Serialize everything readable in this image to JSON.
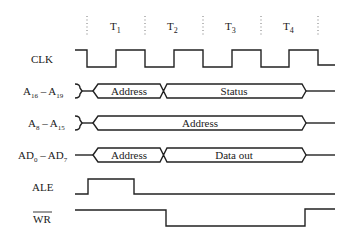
{
  "diagram": {
    "type": "timing-diagram",
    "periods": [
      "T",
      "T",
      "T",
      "T"
    ],
    "period_subscripts": [
      "1",
      "2",
      "3",
      "4"
    ],
    "signals": [
      {
        "name": "CLK",
        "label": "CLK"
      },
      {
        "name": "A16-A19",
        "label_main": "A",
        "sub1": "16",
        "dash": " – A",
        "sub2": "19",
        "segments": [
          "Address",
          "Status"
        ]
      },
      {
        "name": "A8-A15",
        "label_main": "A",
        "sub1": "8",
        "dash": " – A",
        "sub2": "15",
        "segments": [
          "Address"
        ]
      },
      {
        "name": "AD0-AD7",
        "label_main": "AD",
        "sub1": "0",
        "dash": " – AD",
        "sub2": "7",
        "segments": [
          "Address",
          "Data out"
        ]
      },
      {
        "name": "ALE",
        "label": "ALE"
      },
      {
        "name": "WR",
        "label": "WR",
        "active_low": true
      }
    ]
  }
}
